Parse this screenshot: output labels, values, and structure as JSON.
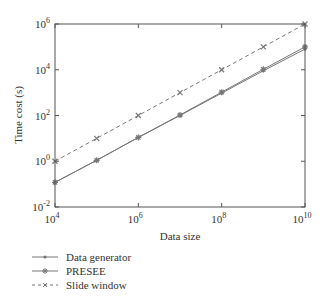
{
  "chart_data": {
    "type": "line",
    "title": "",
    "xlabel": "Data size",
    "ylabel": "Time cost (s)",
    "xscale": "log",
    "yscale": "log",
    "x": [
      10000,
      100000,
      1000000,
      10000000,
      100000000,
      1000000000,
      10000000000
    ],
    "xlim": [
      10000,
      10000000000
    ],
    "ylim": [
      0.01,
      1000000
    ],
    "x_ticks": [
      "10^4",
      "10^6",
      "10^8",
      "10^10"
    ],
    "y_ticks": [
      "10^-2",
      "10^0",
      "10^2",
      "10^4",
      "10^6"
    ],
    "grid": false,
    "legend_position": "below",
    "series": [
      {
        "name": "Data generator",
        "style": "solid",
        "marker": "dot",
        "values": [
          0.12,
          1.1,
          11,
          100,
          950,
          9000,
          80000
        ]
      },
      {
        "name": "PRESEE",
        "style": "solid",
        "marker": "star",
        "values": [
          0.12,
          1.1,
          11,
          105,
          1050,
          10500,
          100000
        ]
      },
      {
        "name": "Slide window",
        "style": "dashed",
        "marker": "x",
        "values": [
          1,
          10,
          100,
          1000,
          10000,
          100000,
          1000000
        ]
      }
    ]
  },
  "axis": {
    "x_label": "Data size",
    "y_label": "Time cost (s)",
    "x_tick_bases": [
      "10",
      "10",
      "10",
      "10"
    ],
    "x_tick_exps": [
      "4",
      "6",
      "8",
      "10"
    ],
    "y_tick_bases": [
      "10",
      "10",
      "10",
      "10",
      "10"
    ],
    "y_tick_exps": [
      "-2",
      "0",
      "2",
      "4",
      "6"
    ]
  },
  "legend": {
    "items": [
      {
        "label": "Data generator"
      },
      {
        "label": "PRESEE"
      },
      {
        "label": "Slide window"
      }
    ]
  },
  "colors": {
    "line": "#777777",
    "axis": "#555555"
  }
}
